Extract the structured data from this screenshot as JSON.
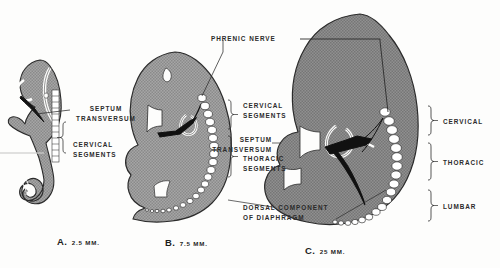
{
  "figure": {
    "background_color": "#fdfdfc",
    "body_fill_color": "#9a9a9a",
    "outline_color": "#2b2b2b",
    "somite_fill_color": "#ffffff",
    "dark_structure_color": "#111111"
  },
  "labels": {
    "phrenic_nerve": "PHRENIC NERVE",
    "septum_transversum_a": "SEPTUM\nTRANSVERSUM",
    "septum_transversum_a_line1": "SEPTUM",
    "septum_transversum_a_line2": "TRANSVERSUM",
    "cervical_segments_a_line1": "CERVICAL",
    "cervical_segments_a_line2": "SEGMENTS",
    "cervical_segments_b_line1": "CERVICAL",
    "cervical_segments_b_line2": "SEGMENTS",
    "septum_transversum_b_line1": "SEPTUM",
    "septum_transversum_b_line2": "TRANSVERSUM",
    "thoracic_segments_b_line1": "THORACIC",
    "thoracic_segments_b_line2": "SEGMENTS",
    "dorsal_component_line1": "DORSAL COMPONENT",
    "dorsal_component_line2": "OF DIAPHRAGM",
    "cervical_c": "CERVICAL",
    "thoracic_c": "THORACIC",
    "lumbar_c": "LUMBAR"
  },
  "panels": [
    {
      "id": "A",
      "letter": "A.",
      "size": "2.5 MM.",
      "description": "Earliest stage embryo, C-shaped with tail, somite column and septum transversum"
    },
    {
      "id": "B",
      "letter": "B.",
      "size": "7.5 MM.",
      "description": "Intermediate embryo with cervical and thoracic somite segments, phrenic nerve descending"
    },
    {
      "id": "C",
      "letter": "C.",
      "size": "25 MM.",
      "description": "Late embryo showing cervical, thoracic and lumbar segments with formed diaphragm"
    }
  ]
}
